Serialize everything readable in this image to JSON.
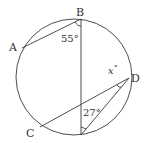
{
  "diagram": {
    "type": "circle-geometry",
    "points": [
      {
        "label": "A",
        "x": 22,
        "y": 48
      },
      {
        "label": "B",
        "x": 81,
        "y": 19
      },
      {
        "label": "C",
        "x": 40,
        "y": 127
      },
      {
        "label": "D",
        "x": 129,
        "y": 78
      }
    ],
    "angles": {
      "angle_b": "55°",
      "angle_bottom": "27°",
      "angle_d_var": "x",
      "angle_d_deg": "°"
    },
    "colors": {
      "stroke": "#3a3a3a",
      "text": "#333333",
      "background": "#ffffff"
    }
  }
}
